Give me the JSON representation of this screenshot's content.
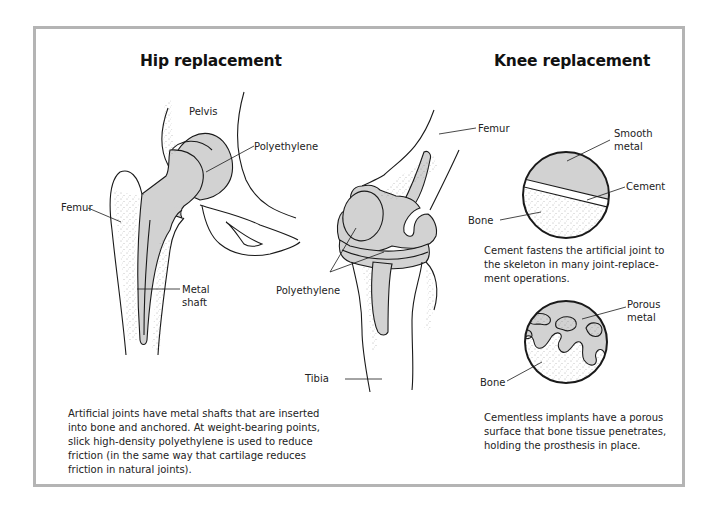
{
  "hip": {
    "title": "Hip replacement",
    "labels": {
      "pelvis": "Pelvis",
      "polyethylene": "Polyethylene",
      "femur": "Femur",
      "metal_shaft_1": "Metal",
      "metal_shaft_2": "shaft"
    },
    "caption": "Artificial joints have metal shafts that are inserted into bone and anchored. At weight-bearing points, slick high-density polyethylene is used to reduce friction (in the same way that cartilage reduces friction in natural joints)."
  },
  "knee": {
    "title": "Knee replacement",
    "labels": {
      "femur": "Femur",
      "polyethylene": "Polyethylene",
      "tibia": "Tibia"
    }
  },
  "cement_detail": {
    "labels": {
      "smooth_metal_1": "Smooth",
      "smooth_metal_2": "metal",
      "cement": "Cement",
      "bone": "Bone"
    },
    "caption": "Cement fastens the artificial joint to the skeleton in many joint-replace- ment operations."
  },
  "porous_detail": {
    "labels": {
      "porous_metal_1": "Porous",
      "porous_metal_2": "metal",
      "bone": "Bone"
    },
    "caption": "Cementless implants have a porous surface that bone tissue penetrates, holding the prosthesis in place."
  },
  "colors": {
    "implant_fill": "#d2d2d2",
    "frame": "#b4b4b4",
    "ink": "#1a1a1a"
  }
}
